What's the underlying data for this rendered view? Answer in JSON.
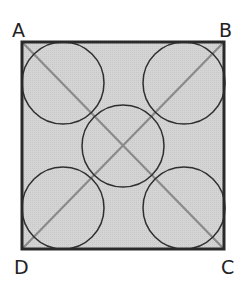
{
  "figure": {
    "colors": {
      "fill": "#d2d2d2",
      "border": "#2a2a2a",
      "diagonal": "#8a8a8a",
      "circle": "#2f2f2f",
      "label": "#222222"
    },
    "square": {
      "x": 22,
      "y": 42,
      "size": 202
    },
    "vertices": [
      {
        "label": "A",
        "x": 22,
        "y": 42
      },
      {
        "label": "B",
        "x": 224,
        "y": 42
      },
      {
        "label": "C",
        "x": 224,
        "y": 249
      },
      {
        "label": "D",
        "x": 22,
        "y": 249
      }
    ],
    "circles": [
      {
        "name": "top-left",
        "cx": 63,
        "cy": 83,
        "r": 41
      },
      {
        "name": "top-right",
        "cx": 184,
        "cy": 83,
        "r": 41
      },
      {
        "name": "center",
        "cx": 123,
        "cy": 146,
        "r": 41
      },
      {
        "name": "bottom-left",
        "cx": 63,
        "cy": 206,
        "r": 41
      },
      {
        "name": "bottom-right",
        "cx": 184,
        "cy": 206,
        "r": 41
      }
    ],
    "diagonals": [
      "AC",
      "BD"
    ]
  },
  "labels": {
    "A": "A",
    "B": "B",
    "C": "C",
    "D": "D"
  }
}
